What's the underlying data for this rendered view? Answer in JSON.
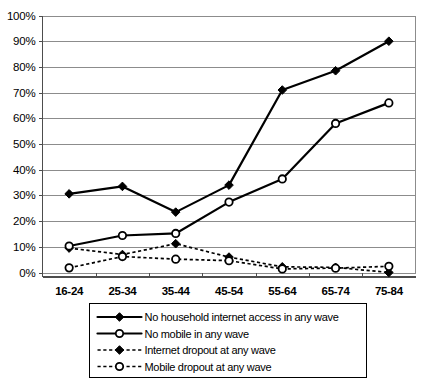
{
  "chart_data": {
    "type": "line",
    "title": "",
    "xlabel": "",
    "ylabel": "",
    "categories": [
      "16-24",
      "25-34",
      "35-44",
      "45-54",
      "55-64",
      "65-74",
      "75-84"
    ],
    "ylim": [
      0,
      100
    ],
    "ytick_labels": [
      "0%",
      "10%",
      "20%",
      "30%",
      "40%",
      "50%",
      "60%",
      "70%",
      "80%",
      "90%",
      "100%"
    ],
    "ytick_values": [
      0,
      10,
      20,
      30,
      40,
      50,
      60,
      70,
      80,
      90,
      100
    ],
    "grid": true,
    "legend_position": "bottom",
    "series": [
      {
        "name": "No household internet access in any wave",
        "marker": "filled-diamond",
        "line_style": "solid",
        "values": [
          30.6,
          33.5,
          23.5,
          34.0,
          71.0,
          78.5,
          90.0
        ]
      },
      {
        "name": "No mobile in any wave",
        "marker": "open-circle",
        "line_style": "solid",
        "values": [
          10.3,
          14.4,
          15.2,
          27.4,
          36.4,
          58.0,
          66.0
        ]
      },
      {
        "name": "Internet dropout at any wave",
        "marker": "filled-diamond",
        "line_style": "dotted",
        "values": [
          9.5,
          7.0,
          11.2,
          6.0,
          2.2,
          2.0,
          0.0
        ]
      },
      {
        "name": "Mobile dropout at any wave",
        "marker": "open-circle",
        "line_style": "dotted",
        "values": [
          1.8,
          6.2,
          5.2,
          4.6,
          1.4,
          1.7,
          2.4
        ]
      }
    ]
  },
  "legend": {
    "items": [
      {
        "label": "No household internet access in any wave"
      },
      {
        "label": "No mobile in any wave"
      },
      {
        "label": "Internet dropout at any wave"
      },
      {
        "label": "Mobile dropout at any wave"
      }
    ]
  },
  "colors": {
    "series_stroke": "#000000",
    "gridline": "#8c8c8c",
    "background": "#ffffff"
  }
}
